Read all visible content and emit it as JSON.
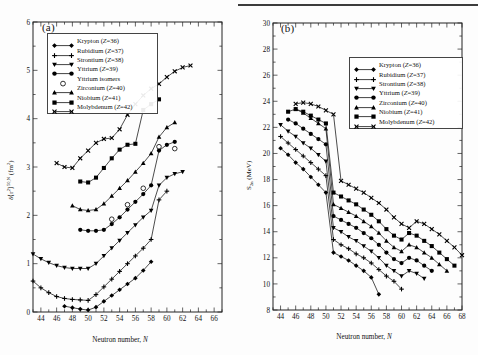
{
  "figure": {
    "panel_a_tag": "(a)",
    "panel_b_tag": "(b)"
  },
  "panel_a": {
    "xlabel_pre": "Neutron number, ",
    "xlabel_it": "N",
    "ylabel": "δ〈r²〉⁵⁰,ᴺ (fm²)",
    "legend": [
      {
        "label": "Krypton (Z=36)",
        "marker": "diamond"
      },
      {
        "label": "Rubidium (Z=37)",
        "marker": "plus"
      },
      {
        "label": "Strontium (Z=38)",
        "marker": "triangle-down"
      },
      {
        "label": "Yttrium (Z=39)",
        "marker": "circle"
      },
      {
        "label": "Yttrium isomers",
        "marker": "open-circle"
      },
      {
        "label": "Zirconium (Z=40)",
        "marker": "triangle-up"
      },
      {
        "label": "Niobium (Z=41)",
        "marker": "square"
      },
      {
        "label": "Molybdenum (Z=42)",
        "marker": "cross"
      }
    ]
  },
  "panel_b": {
    "xlabel_pre": "Neutron number, ",
    "xlabel_it": "N",
    "ylabel": "S₂ₙ (MeV)",
    "legend": [
      {
        "label": "Krypton (Z=36)",
        "marker": "diamond"
      },
      {
        "label": "Rubidium (Z=37)",
        "marker": "plus"
      },
      {
        "label": "Strontium (Z=38)",
        "marker": "triangle-down"
      },
      {
        "label": "Yttrium (Z=39)",
        "marker": "circle"
      },
      {
        "label": "Zirconium (Z=40)",
        "marker": "triangle-up"
      },
      {
        "label": "Niobium (Z=41)",
        "marker": "square"
      },
      {
        "label": "Molybdenum (Z=42)",
        "marker": "cross"
      }
    ]
  },
  "chart_data": [
    {
      "type": "line",
      "panel": "a",
      "title": "(a)",
      "xlabel": "Neutron number, N",
      "ylabel": "δ〈r²〉50,N (fm2)",
      "xlim": [
        43,
        67
      ],
      "ylim": [
        0,
        6
      ],
      "xticks": [
        44,
        46,
        48,
        50,
        52,
        54,
        56,
        58,
        60,
        62,
        64,
        66
      ],
      "yticks": [
        0,
        1,
        2,
        3,
        4,
        5,
        6
      ],
      "minor_ticks": true,
      "grid": false,
      "legend_position": "upper-left",
      "series": [
        {
          "name": "Krypton (Z=36)",
          "marker": "diamond",
          "x": [
            47,
            48,
            49,
            50,
            51,
            52,
            53,
            54,
            55,
            56,
            57,
            58
          ],
          "y": [
            0.12,
            0.09,
            0.06,
            0.04,
            0.1,
            0.22,
            0.34,
            0.46,
            0.58,
            0.7,
            0.86,
            1.04
          ]
        },
        {
          "name": "Rubidium (Z=37)",
          "marker": "plus",
          "x": [
            43,
            44,
            45,
            46,
            47,
            48,
            49,
            50,
            51,
            52,
            53,
            54,
            55,
            56,
            57,
            58,
            59,
            60
          ],
          "y": [
            0.64,
            0.5,
            0.4,
            0.32,
            0.28,
            0.26,
            0.25,
            0.24,
            0.36,
            0.52,
            0.68,
            0.84,
            1.0,
            1.16,
            1.32,
            1.5,
            2.32,
            2.5
          ]
        },
        {
          "name": "Strontium (Z=38)",
          "marker": "triangle-down",
          "x": [
            43,
            44,
            45,
            46,
            47,
            48,
            49,
            50,
            51,
            52,
            53,
            54,
            55,
            56,
            57,
            58,
            59,
            60,
            61,
            62
          ],
          "y": [
            1.2,
            1.1,
            1.02,
            0.96,
            0.92,
            0.9,
            0.9,
            0.9,
            1.0,
            1.16,
            1.32,
            1.48,
            1.64,
            1.8,
            1.96,
            2.1,
            2.62,
            2.78,
            2.86,
            2.9
          ]
        },
        {
          "name": "Yttrium (Z=39)",
          "marker": "circle",
          "x": [
            49,
            50,
            51,
            52,
            53,
            54,
            55,
            56,
            57,
            58,
            59,
            60,
            61
          ],
          "y": [
            1.7,
            1.68,
            1.68,
            1.7,
            1.82,
            1.96,
            2.12,
            2.28,
            2.44,
            2.62,
            3.34,
            3.46,
            3.52
          ]
        },
        {
          "name": "Yttrium isomers",
          "marker": "open-circle",
          "x": [
            53,
            55,
            57,
            59,
            61
          ],
          "y": [
            1.92,
            2.22,
            2.56,
            3.42,
            3.38
          ]
        },
        {
          "name": "Zirconium (Z=40)",
          "marker": "triangle-up",
          "x": [
            48,
            49,
            50,
            51,
            52,
            53,
            54,
            55,
            56,
            57,
            58,
            59,
            60,
            61
          ],
          "y": [
            2.2,
            2.12,
            2.1,
            2.12,
            2.24,
            2.4,
            2.56,
            2.72,
            2.9,
            3.08,
            3.28,
            3.62,
            3.82,
            3.92
          ]
        },
        {
          "name": "Niobium (Z=41)",
          "marker": "square",
          "x": [
            49,
            50,
            51,
            52,
            53,
            54,
            55,
            56,
            57,
            58,
            59
          ],
          "y": [
            2.7,
            2.68,
            2.78,
            2.98,
            3.18,
            3.36,
            3.46,
            3.48,
            4.18,
            4.3,
            4.4
          ]
        },
        {
          "name": "Molybdenum (Z=42)",
          "marker": "cross",
          "x": [
            46,
            47,
            48,
            49,
            50,
            51,
            52,
            53,
            54,
            55,
            56,
            57,
            58,
            59,
            60,
            61,
            62,
            63
          ],
          "y": [
            3.08,
            3.0,
            2.98,
            3.18,
            3.34,
            3.5,
            3.58,
            3.6,
            3.78,
            4.08,
            4.3,
            4.48,
            4.62,
            4.72,
            4.86,
            4.98,
            5.06,
            5.1
          ]
        }
      ]
    },
    {
      "type": "line",
      "panel": "b",
      "title": "(b)",
      "xlabel": "Neutron number, N",
      "ylabel": "S2n (MeV)",
      "xlim": [
        43,
        68
      ],
      "ylim": [
        8,
        30
      ],
      "xticks": [
        44,
        46,
        48,
        50,
        52,
        54,
        56,
        58,
        60,
        62,
        64,
        66,
        68
      ],
      "yticks": [
        8,
        10,
        12,
        14,
        16,
        18,
        20,
        22,
        24,
        26,
        28,
        30
      ],
      "minor_ticks": true,
      "grid": false,
      "legend_position": "upper-right",
      "series": [
        {
          "name": "Krypton (Z=36)",
          "marker": "diamond",
          "x": [
            44,
            45,
            46,
            47,
            48,
            49,
            50,
            51,
            52,
            53,
            54,
            55,
            56,
            57
          ],
          "y": [
            20.4,
            19.9,
            19.3,
            18.8,
            18.2,
            17.6,
            17.0,
            12.4,
            12.1,
            11.8,
            11.4,
            11.0,
            10.5,
            9.2
          ]
        },
        {
          "name": "Rubidium (Z=37)",
          "marker": "plus",
          "x": [
            44,
            45,
            46,
            47,
            48,
            49,
            50,
            51,
            52,
            53,
            54,
            55,
            56,
            57,
            58,
            59,
            60
          ],
          "y": [
            21.3,
            20.8,
            20.3,
            19.8,
            19.3,
            18.8,
            18.3,
            13.4,
            13.0,
            12.7,
            12.3,
            12.0,
            11.6,
            11.1,
            10.6,
            10.2,
            9.6
          ]
        },
        {
          "name": "Strontium (Z=38)",
          "marker": "triangle-down",
          "x": [
            44,
            45,
            46,
            47,
            48,
            49,
            50,
            51,
            52,
            53,
            54,
            55,
            56,
            57,
            58,
            59,
            60,
            61,
            62,
            63
          ],
          "y": [
            22.2,
            21.7,
            21.3,
            20.8,
            20.4,
            19.9,
            19.4,
            14.3,
            14.0,
            13.6,
            13.3,
            12.9,
            12.5,
            12.0,
            11.4,
            11.0,
            10.6,
            11.0,
            10.8,
            10.4
          ]
        },
        {
          "name": "Yttrium (Z=39)",
          "marker": "circle",
          "x": [
            45,
            46,
            47,
            48,
            49,
            50,
            51,
            52,
            53,
            54,
            55,
            56,
            57,
            58,
            59,
            60,
            61,
            62,
            63,
            64
          ],
          "y": [
            22.6,
            22.3,
            21.9,
            21.5,
            21.1,
            20.7,
            15.2,
            14.9,
            14.6,
            14.3,
            13.9,
            13.5,
            13.0,
            12.4,
            11.9,
            11.6,
            12.0,
            11.8,
            11.4,
            11.0
          ]
        },
        {
          "name": "Zirconium (Z=40)",
          "marker": "triangle-up",
          "x": [
            46,
            47,
            48,
            49,
            50,
            51,
            52,
            53,
            54,
            55,
            56,
            57,
            58,
            59,
            60,
            61,
            62,
            63,
            64,
            65,
            66
          ],
          "y": [
            23.4,
            23.1,
            22.7,
            22.3,
            21.9,
            16.1,
            15.8,
            15.5,
            15.2,
            14.8,
            14.4,
            13.9,
            13.3,
            12.8,
            12.5,
            13.0,
            12.8,
            12.4,
            12.0,
            11.5,
            11.0
          ]
        },
        {
          "name": "Niobium (Z=41)",
          "marker": "square",
          "x": [
            45,
            46,
            47,
            48,
            49,
            50,
            51,
            52,
            53,
            54,
            55,
            56,
            57,
            58,
            59,
            60,
            61,
            62,
            63,
            64,
            65,
            66,
            67
          ],
          "y": [
            23.2,
            23.4,
            23.2,
            22.9,
            22.6,
            22.3,
            17.0,
            16.7,
            16.4,
            16.1,
            15.7,
            15.3,
            14.8,
            14.2,
            13.7,
            13.4,
            13.9,
            13.7,
            13.3,
            12.9,
            12.4,
            11.9,
            11.4
          ]
        },
        {
          "name": "Molybdenum (Z=42)",
          "marker": "cross",
          "x": [
            46,
            47,
            48,
            49,
            50,
            51,
            52,
            53,
            54,
            55,
            56,
            57,
            58,
            59,
            60,
            61,
            62,
            63,
            64,
            65,
            66,
            67,
            68
          ],
          "y": [
            23.8,
            23.9,
            23.8,
            23.6,
            23.3,
            23.0,
            17.9,
            17.6,
            17.3,
            17.0,
            16.6,
            16.2,
            15.7,
            15.1,
            14.6,
            14.3,
            14.8,
            14.6,
            14.2,
            13.8,
            13.3,
            12.8,
            12.2
          ]
        }
      ]
    }
  ]
}
